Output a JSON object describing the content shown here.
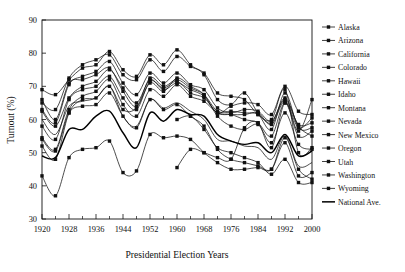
{
  "chart_data": {
    "type": "line",
    "title": "",
    "xlabel": "Presidential Election Years",
    "ylabel": "Turnout (%)",
    "xlim": [
      1920,
      2000
    ],
    "ylim": [
      30,
      90
    ],
    "grid": false,
    "legend_position": "right",
    "xticks": [
      1920,
      1928,
      1936,
      1944,
      1952,
      1960,
      1968,
      1976,
      1984,
      1992,
      2000
    ],
    "xticks_minor": [
      1924,
      1932,
      1940,
      1948,
      1956,
      1964,
      1972,
      1980,
      1988,
      1996
    ],
    "yticks": [
      30,
      40,
      50,
      60,
      70,
      80,
      90
    ],
    "x": [
      1920,
      1924,
      1928,
      1932,
      1936,
      1940,
      1944,
      1948,
      1952,
      1956,
      1960,
      1964,
      1968,
      1972,
      1976,
      1980,
      1984,
      1988,
      1992,
      1996,
      2000
    ],
    "series": [
      {
        "name": "Alaska",
        "marker": "square",
        "values": [
          null,
          null,
          null,
          null,
          null,
          null,
          null,
          null,
          null,
          null,
          45.5,
          51.0,
          50.0,
          48.5,
          48.0,
          57.5,
          59.0,
          51.5,
          65.0,
          56.5,
          66.0
        ]
      },
      {
        "name": "Arizona",
        "marker": "square",
        "values": [
          43.0,
          37.0,
          48.5,
          51.0,
          51.5,
          53.5,
          44.0,
          44.5,
          55.5,
          54.5,
          55.0,
          54.0,
          50.0,
          47.0,
          45.0,
          45.0,
          45.5,
          45.0,
          54.5,
          45.0,
          42.0
        ]
      },
      {
        "name": "California",
        "marker": "square",
        "values": [
          52.0,
          48.0,
          62.0,
          66.0,
          66.5,
          70.0,
          63.0,
          63.5,
          71.0,
          68.5,
          72.5,
          70.0,
          67.5,
          61.0,
          58.0,
          57.0,
          58.5,
          53.0,
          62.0,
          52.5,
          51.0
        ]
      },
      {
        "name": "Colorado",
        "marker": "square",
        "values": [
          66.0,
          60.0,
          71.0,
          72.0,
          73.5,
          75.5,
          68.5,
          64.0,
          72.5,
          70.0,
          72.0,
          69.5,
          67.5,
          62.5,
          62.5,
          62.0,
          61.5,
          57.0,
          68.0,
          57.5,
          57.5
        ]
      },
      {
        "name": "Hawaii",
        "marker": "square",
        "values": [
          null,
          null,
          null,
          null,
          null,
          null,
          null,
          null,
          null,
          null,
          60.0,
          61.0,
          57.0,
          51.5,
          50.0,
          48.5,
          47.0,
          43.5,
          48.0,
          41.0,
          41.0
        ]
      },
      {
        "name": "Idaho",
        "marker": "square",
        "values": [
          69.0,
          67.5,
          72.0,
          75.5,
          76.5,
          80.5,
          75.0,
          73.0,
          79.5,
          76.5,
          81.0,
          76.5,
          73.5,
          66.0,
          64.5,
          68.0,
          62.0,
          59.0,
          66.5,
          58.0,
          55.0
        ]
      },
      {
        "name": "Montana",
        "marker": "square",
        "values": [
          62.5,
          58.0,
          66.5,
          70.0,
          71.5,
          75.0,
          69.5,
          65.0,
          72.0,
          69.0,
          71.0,
          69.0,
          67.0,
          62.0,
          64.0,
          65.0,
          64.5,
          61.5,
          70.0,
          62.5,
          61.5
        ]
      },
      {
        "name": "Nevada",
        "marker": "square",
        "values": [
          54.0,
          50.5,
          62.0,
          64.0,
          64.5,
          68.0,
          61.0,
          57.5,
          66.0,
          63.0,
          64.5,
          61.0,
          58.0,
          51.0,
          48.0,
          47.0,
          46.0,
          45.0,
          53.0,
          43.0,
          44.0
        ]
      },
      {
        "name": "New Mexico",
        "marker": "none",
        "values": [
          60.0,
          55.5,
          64.0,
          65.5,
          66.5,
          70.0,
          61.0,
          58.0,
          66.0,
          63.5,
          65.0,
          62.5,
          60.0,
          54.0,
          53.5,
          52.0,
          51.5,
          48.0,
          55.0,
          46.0,
          47.0
        ]
      },
      {
        "name": "Oregon",
        "marker": "square",
        "values": [
          58.0,
          54.0,
          66.0,
          69.0,
          70.0,
          73.0,
          66.5,
          63.0,
          71.5,
          69.5,
          71.5,
          68.0,
          66.5,
          62.0,
          61.5,
          61.5,
          62.0,
          58.5,
          65.5,
          57.5,
          60.5
        ]
      },
      {
        "name": "Utah",
        "marker": "square",
        "values": [
          65.0,
          63.0,
          72.5,
          76.5,
          78.0,
          79.5,
          73.5,
          72.0,
          78.0,
          74.5,
          79.0,
          76.0,
          74.0,
          68.0,
          67.0,
          66.0,
          61.5,
          60.0,
          69.0,
          50.0,
          51.5
        ]
      },
      {
        "name": "Washington",
        "marker": "square",
        "values": [
          54.5,
          51.0,
          63.0,
          67.0,
          68.5,
          72.0,
          64.5,
          61.0,
          69.0,
          67.0,
          70.5,
          67.0,
          65.5,
          62.0,
          61.5,
          60.0,
          59.0,
          55.0,
          65.0,
          55.0,
          56.5
        ]
      },
      {
        "name": "Wyoming",
        "marker": "square",
        "values": [
          63.0,
          59.0,
          70.5,
          73.0,
          74.5,
          77.5,
          71.0,
          67.5,
          74.0,
          71.0,
          74.0,
          70.5,
          69.0,
          63.5,
          62.0,
          63.0,
          62.5,
          59.5,
          66.0,
          58.5,
          59.0
        ]
      },
      {
        "name": "National Ave.",
        "marker": "none",
        "values": [
          49.0,
          48.5,
          57.0,
          57.0,
          61.0,
          62.5,
          56.0,
          51.5,
          62.0,
          59.5,
          63.0,
          61.5,
          61.0,
          55.5,
          53.5,
          52.5,
          53.0,
          50.0,
          55.5,
          49.0,
          50.5
        ]
      }
    ]
  },
  "legend": {
    "items": [
      {
        "label": "Alaska"
      },
      {
        "label": "Arizona"
      },
      {
        "label": "California"
      },
      {
        "label": "Colorado"
      },
      {
        "label": "Hawaii"
      },
      {
        "label": "Idaho"
      },
      {
        "label": "Montana"
      },
      {
        "label": "Nevada"
      },
      {
        "label": "New Mexico"
      },
      {
        "label": "Oregon"
      },
      {
        "label": "Utah"
      },
      {
        "label": "Washington"
      },
      {
        "label": "Wyoming"
      },
      {
        "label": "National Ave."
      }
    ]
  }
}
